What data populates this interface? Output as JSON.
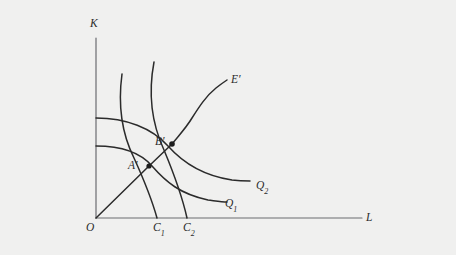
{
  "figure": {
    "background_color": "#f0f0ef",
    "ink_color": "#2b2b2b",
    "axis_color": "#55565a"
  },
  "axes": {
    "origin_label": "O",
    "y_axis_label": "K",
    "x_axis_label": "L",
    "origin_px": {
      "x": 96,
      "y": 218
    },
    "y_axis_top_px": {
      "x": 96,
      "y": 38
    },
    "x_axis_right_px": {
      "x": 362,
      "y": 218
    }
  },
  "tick_labels": [
    {
      "name": "c1",
      "text": "C",
      "sub": "1",
      "x_px": 158
    },
    {
      "name": "c2",
      "text": "C",
      "sub": "2",
      "x_px": 188
    }
  ],
  "points": [
    {
      "name": "A-prime",
      "label": "A",
      "prime": "′",
      "x_px": 149,
      "y_px": 166
    },
    {
      "name": "B-prime",
      "label": "B",
      "prime": "′",
      "x_px": 172,
      "y_px": 144
    }
  ],
  "curve_labels": [
    {
      "name": "expansion-path",
      "text": "E",
      "prime": "′",
      "sub": "",
      "x_px": 232,
      "y_px": 80
    },
    {
      "name": "isoquant-q2",
      "text": "Q",
      "prime": "",
      "sub": "2",
      "x_px": 257,
      "y_px": 186
    },
    {
      "name": "isoquant-q1",
      "text": "Q",
      "prime": "",
      "sub": "1",
      "x_px": 226,
      "y_px": 204
    }
  ],
  "chart_data": {
    "type": "line",
    "title": "",
    "xlabel": "L",
    "ylabel": "K",
    "grid": false,
    "legend": "none",
    "axis_origin": {
      "x": 96,
      "y": 218
    },
    "series": [
      {
        "name": "isoquant-q1",
        "label": "Q1",
        "path": "M 96 146 C 120 146 140 152 152 166 C 166 182 180 194 208 200 C 216 201 222 202 227 202"
      },
      {
        "name": "isoquant-q2",
        "label": "Q2",
        "path": "M 96 118 C 126 118 152 128 168 146 C 184 164 205 176 232 180 C 240 181 246 181 250 181"
      },
      {
        "name": "isocost-c1",
        "label": "C1",
        "path": "M 122 74 C 118 104 122 134 134 158 C 144 180 152 200 157 218"
      },
      {
        "name": "isocost-c2",
        "label": "C2",
        "path": "M 154 62 C 148 94 152 124 164 150 C 174 174 183 200 187 218"
      },
      {
        "name": "expansion-path-ray",
        "label": "E' lower ray",
        "path": "M 96 218 L 149 166 L 172 144"
      },
      {
        "name": "expansion-path-curve",
        "label": "E' upper curve",
        "path": "M 172 144 C 180 134 186 128 192 118 C 199 107 206 96 216 88 C 221 84 224 82 227 80"
      }
    ]
  }
}
